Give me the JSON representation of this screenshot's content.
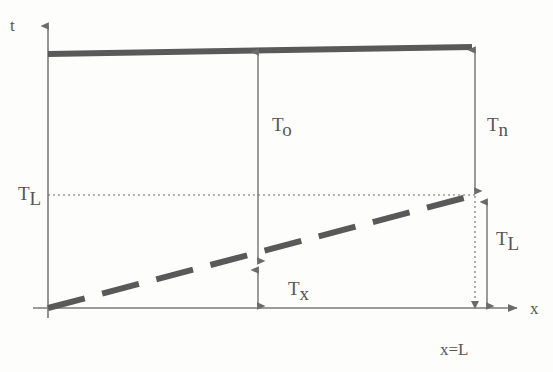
{
  "figure": {
    "background_color": "#fdfdfc",
    "ink_color": "#595959",
    "thin_line_color": "#777777"
  },
  "axes": {
    "y_axis_label": "t",
    "x_axis_label": "x",
    "origin_note": "x=L",
    "x_axis": {
      "y": 308,
      "x_start": 48,
      "x_end": 523,
      "arrow": "right"
    },
    "y_axis": {
      "x": 48,
      "y_start": 318,
      "y_end": 22,
      "arrow": "up"
    }
  },
  "curves": {
    "top_line": {
      "name": "initial-temperature-line",
      "style": "thick-solid",
      "x1": 48,
      "y1": 54,
      "x2": 472,
      "y2": 47,
      "stroke_width": 6
    },
    "diagonal_line": {
      "name": "linear-temperature-profile",
      "style": "thick-dashed",
      "x1": 48,
      "y1": 308,
      "x2": 475,
      "y2": 195,
      "stroke_width": 6,
      "dash_pattern": "38 18"
    },
    "horizontal_dotted": {
      "name": "tl-level-line",
      "style": "fine-dotted",
      "x1": 48,
      "y1": 195,
      "x2": 476,
      "y2": 195,
      "dash_pattern": "2 3"
    },
    "vertical_dotted": {
      "name": "x-equals-l-line",
      "style": "fine-dotted",
      "x1": 475,
      "y1": 196,
      "x2": 475,
      "y2": 308,
      "dash_pattern": "2 3"
    }
  },
  "dimensions": [
    {
      "id": "t-o",
      "label": "T",
      "subscript": "o",
      "name": "dimension-t-o",
      "x": 258,
      "y_top": 50,
      "y_bottom": 263,
      "arrows": "both",
      "label_x": 272,
      "label_y": 131
    },
    {
      "id": "t-x",
      "label": "T",
      "subscript": "x",
      "name": "dimension-t-x",
      "x": 258,
      "y_top": 268,
      "y_bottom": 308,
      "arrows": "both",
      "label_x": 288,
      "label_y": 295
    },
    {
      "id": "t-n",
      "label": "T",
      "subscript": "n",
      "name": "dimension-t-n",
      "x": 475,
      "y_top": 48,
      "y_bottom": 193,
      "arrows": "both",
      "label_x": 487,
      "label_y": 131
    },
    {
      "id": "t-l-right",
      "label": "T",
      "subscript": "L",
      "name": "dimension-t-l-right",
      "x": 487,
      "y_top": 200,
      "y_bottom": 308,
      "arrows": "both",
      "label_x": 496,
      "label_y": 245
    }
  ],
  "tick_labels": [
    {
      "id": "t-l-left",
      "label": "T",
      "subscript": "L",
      "name": "axis-tick-label-t-l",
      "x": 18,
      "y": 200
    }
  ]
}
